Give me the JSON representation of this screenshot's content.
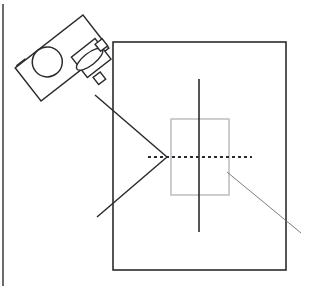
{
  "figure": {
    "title": "Camera projection onto a planar target",
    "background_color": "#ffffff",
    "width": 317,
    "height": 288,
    "line_color_dark": "#2b2b2f",
    "line_color_gray": "#b3b3b3",
    "page_border_color": "#2b2b2f"
  },
  "page_border": {
    "label": "page-edge-rule",
    "x": 3,
    "y_top": 4,
    "y_bottom": 286
  },
  "camera": {
    "label": "camera",
    "body_label": "camera-body",
    "rotation_degrees": -38,
    "body": {
      "cx": 62,
      "cy": 58,
      "width": 86,
      "height": 42
    },
    "reel": {
      "label": "camera-reel-circle",
      "cx": 48,
      "cy": 52,
      "r": 15
    },
    "tab": {
      "label": "camera-tab-square",
      "cx": 27,
      "cy": 41,
      "size": 10
    },
    "lens_barrel": {
      "label": "camera-lens-barrel",
      "cx": 85,
      "cy": 76,
      "width": 30,
      "height": 26
    },
    "lens_aperture": {
      "label": "camera-lens-aperture-ellipse",
      "cx": 83,
      "cy": 76,
      "rx": 16,
      "ry": 6
    },
    "mount_front": {
      "label": "camera-mount-front-square",
      "cx": 101,
      "cy": 72,
      "size": 9
    },
    "mount_rear": {
      "label": "camera-mount-rear-square",
      "cx": 79,
      "cy": 97,
      "size": 9
    }
  },
  "target_board": {
    "label": "target-board-rectangle",
    "x": 113,
    "y": 42,
    "width": 173,
    "height": 228,
    "stroke": "#2b2b2f",
    "stroke_width": 1.6
  },
  "inner_patch": {
    "label": "inner-gray-patch-rectangle",
    "x": 171,
    "y": 119,
    "width": 58,
    "height": 76,
    "stroke": "#b3b3b3",
    "stroke_width": 1.3
  },
  "vertical_axis": {
    "label": "vertical-axis-line",
    "x": 199,
    "y_top": 79,
    "y_bottom": 232,
    "stroke": "#2b2b2f",
    "stroke_width": 1.6
  },
  "optical_axis": {
    "label": "optical-axis-dotted-line",
    "y": 157,
    "x_start": 148,
    "x_end": 252,
    "stroke": "#2b2b2f",
    "stroke_width": 2.2,
    "dash_pattern": "3 3"
  },
  "convergence_point": {
    "label": "ray-convergence-point",
    "x": 167,
    "y": 157
  },
  "rays": [
    {
      "label": "upper-ray",
      "x1": 95,
      "y1": 95,
      "x2": 167,
      "y2": 157,
      "stroke": "#2b2b2f",
      "stroke_width": 1.5
    },
    {
      "label": "lower-ray",
      "x1": 167,
      "y1": 157,
      "x2": 97,
      "y2": 217,
      "stroke": "#2b2b2f",
      "stroke_width": 1.5
    }
  ],
  "thin_diagonal": {
    "label": "thin-diagonal-line",
    "x1": 227,
    "y1": 172,
    "x2": 301,
    "y2": 233,
    "stroke": "#6e6e72",
    "stroke_width": 0.9
  }
}
